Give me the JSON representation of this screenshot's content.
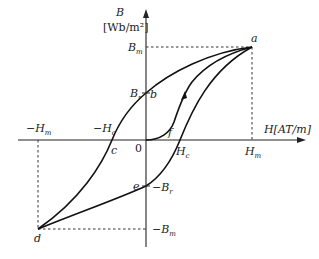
{
  "diagram": {
    "axes": {
      "y_label": "B",
      "y_unit": "[Wb/m²]",
      "x_label": "H[AT/m]",
      "origin": "0"
    },
    "points": {
      "a": "a",
      "b": "b",
      "c": "c",
      "d": "d",
      "e": "e",
      "f": "f"
    },
    "axis_marks": {
      "Bm": "B",
      "Bm_sub": "m",
      "Br": "B",
      "Br_sub": "r",
      "neg_Br": "−B",
      "neg_Br_sub": "r",
      "neg_Bm": "−B",
      "neg_Bm_sub": "m",
      "Hm": "H",
      "Hm_sub": "m",
      "Hc": "H",
      "Hc_sub": "c",
      "neg_Hc": "−H",
      "neg_Hc_sub": "c",
      "neg_Hm": "−H",
      "neg_Hm_sub": "m"
    },
    "colors": {
      "curve": "#111111",
      "axis": "#222222",
      "background": "#ffffff"
    }
  }
}
